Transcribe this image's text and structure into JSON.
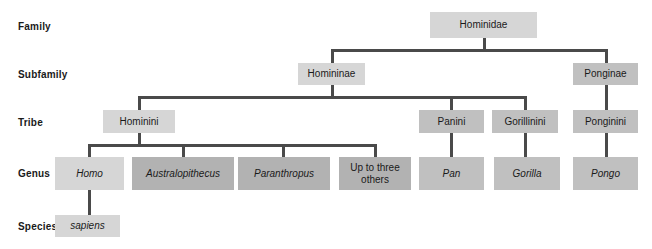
{
  "diagram": {
    "colors": {
      "box_light": "#d6d6d6",
      "box_medium": "#c0c0c0",
      "box_dark": "#b2b2b2",
      "connector": "#4a4a4a",
      "background": "#ffffff",
      "text": "#1a1a1a"
    },
    "rank_labels": [
      {
        "label": "Family"
      },
      {
        "label": "Subfamily"
      },
      {
        "label": "Tribe"
      },
      {
        "label": "Genus"
      },
      {
        "label": "Species"
      }
    ],
    "nodes": {
      "hominidae": {
        "label": "Hominidae",
        "rank": "Family"
      },
      "homininae": {
        "label": "Homininae",
        "rank": "Subfamily"
      },
      "ponginae": {
        "label": "Ponginae",
        "rank": "Subfamily"
      },
      "hominini": {
        "label": "Hominini",
        "rank": "Tribe"
      },
      "panini": {
        "label": "Panini",
        "rank": "Tribe"
      },
      "gorillinini": {
        "label": "Gorillinini",
        "rank": "Tribe"
      },
      "ponginini": {
        "label": "Ponginini",
        "rank": "Tribe"
      },
      "homo": {
        "label": "Homo",
        "rank": "Genus"
      },
      "australopithecus": {
        "label": "Australopithecus",
        "rank": "Genus"
      },
      "paranthropus": {
        "label": "Paranthropus",
        "rank": "Genus"
      },
      "up_to_three_others": {
        "label": "Up to three\nothers",
        "rank": "Genus"
      },
      "pan": {
        "label": "Pan",
        "rank": "Genus"
      },
      "gorilla": {
        "label": "Gorilla",
        "rank": "Genus"
      },
      "pongo": {
        "label": "Pongo",
        "rank": "Genus"
      },
      "sapiens": {
        "label": "sapiens",
        "rank": "Species"
      }
    }
  }
}
